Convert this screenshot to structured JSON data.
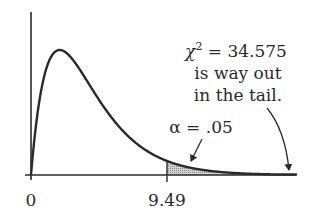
{
  "chart_data": {
    "type": "area",
    "title": "",
    "distribution": "chi-square",
    "degrees_of_freedom": 4,
    "xlabel": "",
    "ylabel": "",
    "xlim": [
      0,
      18.5
    ],
    "ylim": [
      0,
      0.2
    ],
    "grid": false,
    "legend": null,
    "x_ticks": [
      {
        "value": 0,
        "label": "0"
      },
      {
        "value": 9.49,
        "label": "9.49"
      }
    ],
    "x": [
      0,
      0.25,
      0.5,
      1,
      1.5,
      2,
      3,
      4,
      5,
      6,
      7,
      8,
      9,
      9.49,
      10,
      11,
      12,
      13,
      14,
      15,
      16,
      17,
      18.5
    ],
    "series": [
      {
        "name": "chi-square density (df=4)",
        "values": [
          0,
          0.0552,
          0.0974,
          0.1516,
          0.1771,
          0.1839,
          0.1673,
          0.1353,
          0.1026,
          0.0747,
          0.0528,
          0.0366,
          0.025,
          0.0206,
          0.0168,
          0.0112,
          0.0074,
          0.0049,
          0.0032,
          0.0021,
          0.0013,
          0.0009,
          0.0004
        ]
      }
    ],
    "shaded_region": {
      "from": 9.49,
      "to": 18.5,
      "label": "α = .05",
      "area": 0.05
    },
    "critical_value": 9.49,
    "annotations": [
      {
        "text_lines": [
          "χ² = 34.575",
          "is way out",
          "in the tail."
        ],
        "points_to": "far right tail"
      },
      {
        "text": "α = .05",
        "points_to": "shaded rejection region"
      }
    ]
  },
  "labels": {
    "tick_0": "0",
    "tick_crit": "9.49",
    "alpha": "α = .05",
    "chi_line1_sym": "χ",
    "chi_line1_sup": "2",
    "chi_line1_rest": " = 34.575",
    "chi_line2": "is way out",
    "chi_line3": "in the tail."
  },
  "colors": {
    "ink": "#2a2a2a",
    "shade": "#bdbdbd"
  }
}
